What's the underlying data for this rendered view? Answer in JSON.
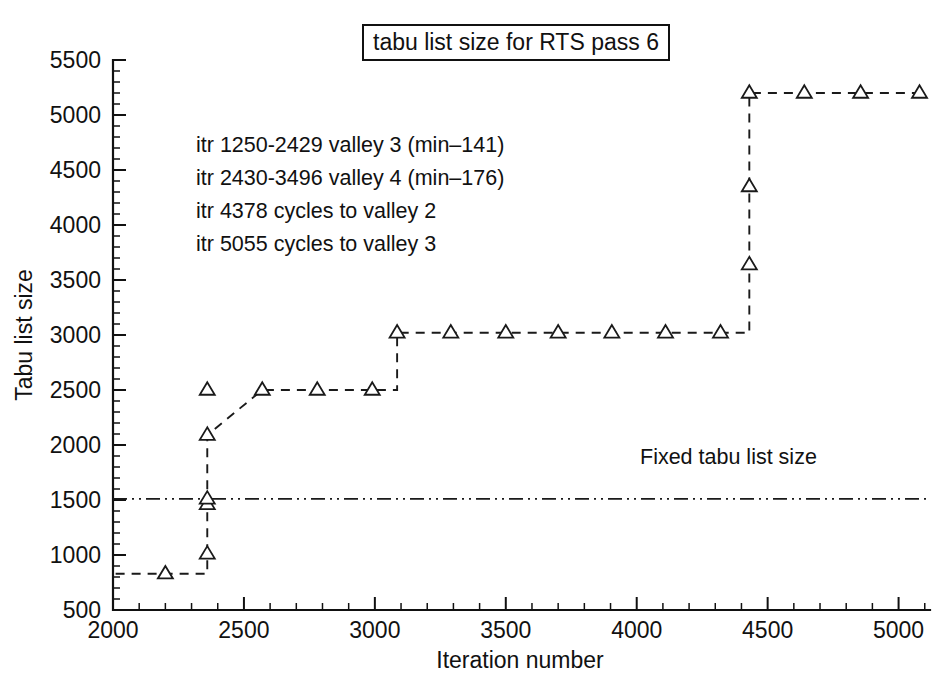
{
  "figure": {
    "title": "tabu list size for RTS pass 6",
    "background_color": "#ffffff",
    "line_color": "#1a1a1a"
  },
  "chart_data": {
    "type": "line",
    "title": "tabu list size for RTS pass 6",
    "xlabel": "Iteration number",
    "ylabel": "Tabu list size",
    "xlim": [
      2000,
      5120
    ],
    "ylim": [
      500,
      5500
    ],
    "xticks": [
      2000,
      2500,
      3000,
      3500,
      4000,
      4500,
      5000
    ],
    "xtick_labels": [
      "2000",
      "2500",
      "3000",
      "3500",
      "4000",
      "4500",
      "5000"
    ],
    "yticks": [
      500,
      1000,
      1500,
      2000,
      2500,
      3000,
      3500,
      4000,
      4500,
      5000,
      5500
    ],
    "ytick_labels": [
      "500",
      "1000",
      "1500",
      "2000",
      "2500",
      "3000",
      "3500",
      "4000",
      "4500",
      "5000",
      "5500"
    ],
    "x_minor_tick_step": 100,
    "y_minor_tick_step": 100,
    "grid": false,
    "legend": null,
    "marker": "open-triangle-up",
    "linestyle": "dashed",
    "series": [
      {
        "name": "Reactive tabu list size",
        "x": [
          2010,
          2200,
          2360,
          2360,
          2360,
          2360,
          2360,
          2570,
          2780,
          2990,
          3085,
          3085,
          3290,
          3500,
          3700,
          3905,
          4110,
          4320,
          4430,
          4430,
          4430,
          4430,
          4640,
          4855,
          5080
        ],
        "y": [
          830,
          830,
          830,
          1010,
          1460,
          1510,
          2090,
          2500,
          2500,
          2500,
          2500,
          3020,
          3020,
          3020,
          3020,
          3020,
          3020,
          3020,
          3020,
          3640,
          4350,
          5200,
          5200,
          5200,
          5200
        ],
        "marker_points": [
          {
            "x": 2200,
            "y": 830
          },
          {
            "x": 2360,
            "y": 1010
          },
          {
            "x": 2360,
            "y": 1460
          },
          {
            "x": 2360,
            "y": 1510
          },
          {
            "x": 2360,
            "y": 2090
          },
          {
            "x": 2360,
            "y": 2500
          },
          {
            "x": 2570,
            "y": 2500
          },
          {
            "x": 2780,
            "y": 2500
          },
          {
            "x": 2990,
            "y": 2500
          },
          {
            "x": 3085,
            "y": 3020
          },
          {
            "x": 3290,
            "y": 3020
          },
          {
            "x": 3500,
            "y": 3020
          },
          {
            "x": 3700,
            "y": 3020
          },
          {
            "x": 3905,
            "y": 3020
          },
          {
            "x": 4110,
            "y": 3020
          },
          {
            "x": 4320,
            "y": 3020
          },
          {
            "x": 4430,
            "y": 3640
          },
          {
            "x": 4430,
            "y": 4350
          },
          {
            "x": 4430,
            "y": 5200
          },
          {
            "x": 4640,
            "y": 5200
          },
          {
            "x": 4855,
            "y": 5200
          },
          {
            "x": 5080,
            "y": 5200
          }
        ]
      },
      {
        "name": "Fixed tabu list size",
        "linestyle": "dash-dot-dot",
        "marker": "none",
        "x": [
          2000,
          5120
        ],
        "y": [
          1510,
          1510
        ]
      }
    ],
    "annotations": [
      {
        "text": "itr 1250-2429 valley 3 (min–141)",
        "x": 2250,
        "y": 4670
      },
      {
        "text": "itr 2430-3496 valley 4 (min–176)",
        "x": 2250,
        "y": 4350
      },
      {
        "text": "itr 4378 cycles to valley 2",
        "x": 2250,
        "y": 4020
      },
      {
        "text": "itr 5055 cycles to valley 3",
        "x": 2250,
        "y": 3700
      },
      {
        "text": "Fixed tabu list size",
        "x": 4080,
        "y": 1790
      }
    ]
  },
  "annotations": {
    "line1": "itr 1250-2429 valley 3 (min–141)",
    "line2": "itr 2430-3496 valley 4 (min–176)",
    "line3": "itr 4378 cycles to valley 2",
    "line4": "itr 5055 cycles to valley 3",
    "reference_label": "Fixed tabu list size"
  },
  "axes": {
    "x_title": "Iteration number",
    "y_title": "Tabu list size",
    "x_labels": [
      "2000",
      "2500",
      "3000",
      "3500",
      "4000",
      "4500",
      "5000"
    ],
    "y_labels": [
      "500",
      "1000",
      "1500",
      "2000",
      "2500",
      "3000",
      "3500",
      "4000",
      "4500",
      "5000",
      "5500"
    ]
  }
}
